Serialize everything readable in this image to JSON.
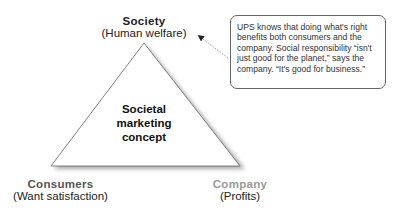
{
  "diagram": {
    "center_label": [
      "Societal",
      "marketing",
      "concept"
    ],
    "vertices": {
      "top": {
        "title": "Society",
        "subtitle": "(Human welfare)"
      },
      "bottom_left": {
        "title": "Consumers",
        "subtitle": "(Want satisfaction)"
      },
      "bottom_right": {
        "title": "Company",
        "subtitle": "(Profits)"
      }
    },
    "callout": {
      "text": "UPS knows that doing what's right benefits both consumers and the company. Social responsibility “isn't just good for the planet,” says the company. “It's good for business.”"
    },
    "colors": {
      "top_title": "#222222",
      "consumers_title": "#555555",
      "company_title": "#9a9a9a",
      "triangle_stroke": "#555555",
      "shadow": "#aaaaaa"
    }
  }
}
